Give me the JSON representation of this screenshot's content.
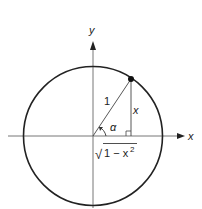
{
  "diagram": {
    "type": "unit-circle",
    "axes": {
      "x_label": "x",
      "y_label": "y"
    },
    "labels": {
      "hypotenuse": "1",
      "opposite": "x",
      "angle": "α",
      "adjacent_sqrt": "√",
      "adjacent_expr": "1 − x",
      "adjacent_exp": "2"
    },
    "colors": {
      "stroke": "#222222",
      "axis": "#555555",
      "point": "#111111"
    }
  }
}
